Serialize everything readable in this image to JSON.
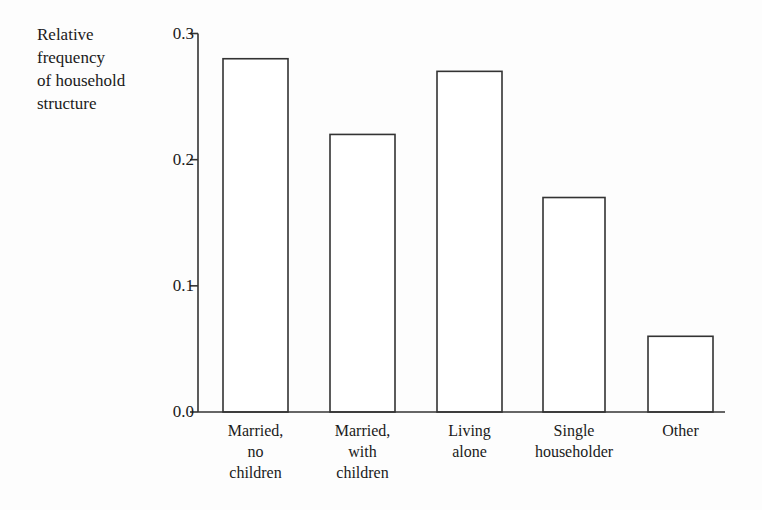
{
  "chart_data": {
    "type": "bar",
    "title": "",
    "subtitle": "",
    "xlabel": "",
    "ylabel": "Relative\nfrequency\nof household\nstructure",
    "categories": [
      "Married,\nno\nchildren",
      "Married,\nwith\nchildren",
      "Living\nalone",
      "Single\nhouseholder",
      "Other"
    ],
    "values": [
      0.28,
      0.22,
      0.27,
      0.17,
      0.06
    ],
    "ylim": [
      0.0,
      0.3
    ],
    "yticks": [
      "0.0",
      "0.1",
      "0.2",
      "0.3"
    ],
    "ytick_values": [
      0.0,
      0.1,
      0.2,
      0.3
    ],
    "grid": false,
    "legend": null,
    "bar_fill": "#ffffff",
    "bar_stroke": "#333333",
    "axis_color": "#333333",
    "background": "#fdfdfd"
  },
  "axis": {
    "y_title_line_1": "Relative",
    "y_title_line_2": "frequency",
    "y_title_line_3": "of household",
    "y_title_line_4": "structure"
  }
}
